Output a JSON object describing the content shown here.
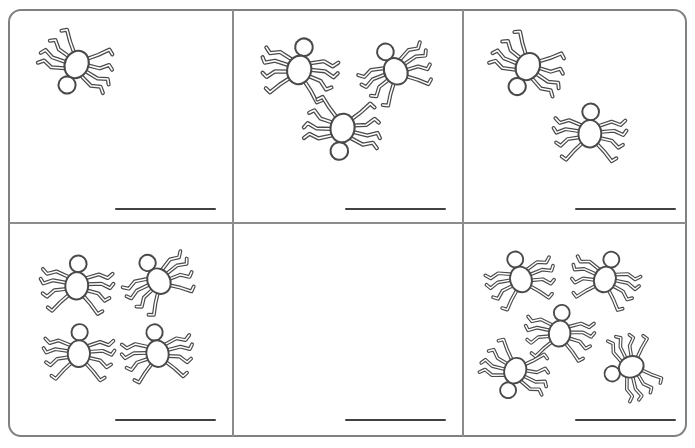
{
  "worksheet": {
    "title": "Spider Counting Worksheet",
    "subject": "counting",
    "object_name": "spider",
    "grid": {
      "columns": 3,
      "rows": 2
    },
    "colors": {
      "background": "#ffffff",
      "border": "#808080",
      "divider": "#8c8c8c",
      "answer_line": "#414141",
      "spider_outline": "#4a4a4a",
      "spider_fill": "#ffffff"
    },
    "cells": [
      {
        "id": "cell-1",
        "position": "top-left",
        "row": 1,
        "column": 1,
        "spider_count": 1,
        "answer_value": "",
        "answer_line_label": "answer-line",
        "spiders": [
          {
            "x": 16,
            "y": 8,
            "scale": 0.78,
            "rotation": 205
          }
        ]
      },
      {
        "id": "cell-2",
        "position": "top-middle",
        "row": 1,
        "column": 2,
        "spider_count": 3,
        "answer_value": "",
        "answer_line_label": "answer-line",
        "spiders": [
          {
            "x": 16,
            "y": 6,
            "scale": 0.8,
            "rotation": 12
          },
          {
            "x": 110,
            "y": 8,
            "scale": 0.76,
            "rotation": 332
          },
          {
            "x": 58,
            "y": 72,
            "scale": 0.8,
            "rotation": 188
          }
        ]
      },
      {
        "id": "cell-3",
        "position": "top-right",
        "row": 1,
        "column": 3,
        "spider_count": 2,
        "answer_value": "",
        "answer_line_label": "answer-line",
        "spiders": [
          {
            "x": 12,
            "y": 10,
            "scale": 0.78,
            "rotation": 208
          },
          {
            "x": 76,
            "y": 70,
            "scale": 0.76,
            "rotation": 2
          }
        ]
      },
      {
        "id": "cell-4",
        "position": "bottom-left",
        "row": 2,
        "column": 1,
        "spider_count": 4,
        "answer_value": "",
        "answer_line_label": "answer-line",
        "spiders": [
          {
            "x": 18,
            "y": 8,
            "scale": 0.76,
            "rotation": 4
          },
          {
            "x": 98,
            "y": 4,
            "scale": 0.74,
            "rotation": 328
          },
          {
            "x": 20,
            "y": 76,
            "scale": 0.74,
            "rotation": 2
          },
          {
            "x": 98,
            "y": 76,
            "scale": 0.74,
            "rotation": 352
          }
        ]
      },
      {
        "id": "cell-5",
        "position": "bottom-middle",
        "row": 2,
        "column": 2,
        "spider_count": 0,
        "answer_value": "",
        "answer_line_label": "answer-line",
        "spiders": []
      },
      {
        "id": "cell-6",
        "position": "bottom-right",
        "row": 2,
        "column": 3,
        "spider_count": 5,
        "answer_value": "",
        "answer_line_label": "answer-line",
        "spiders": [
          {
            "x": 6,
            "y": 2,
            "scale": 0.72,
            "rotation": 344
          },
          {
            "x": 92,
            "y": 2,
            "scale": 0.72,
            "rotation": 18
          },
          {
            "x": 46,
            "y": 56,
            "scale": 0.72,
            "rotation": 6
          },
          {
            "x": 0,
            "y": 100,
            "scale": 0.72,
            "rotation": 200
          },
          {
            "x": 114,
            "y": 94,
            "scale": 0.7,
            "rotation": 250
          }
        ]
      }
    ]
  }
}
